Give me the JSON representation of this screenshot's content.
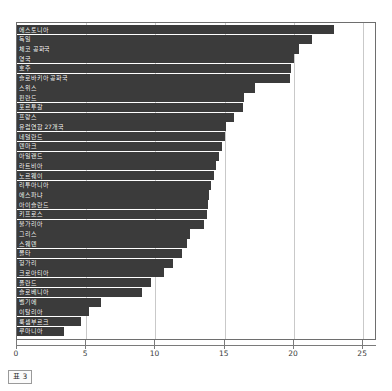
{
  "caption": "표 3",
  "chart_data": {
    "type": "bar",
    "orientation": "horizontal",
    "title": "",
    "subtitle": "",
    "xlabel": "",
    "ylabel": "",
    "xlim": [
      0,
      26
    ],
    "xticks": [
      0,
      5,
      10,
      15,
      20,
      25
    ],
    "tick_labels": [
      "0",
      "5",
      "10",
      "15",
      "20",
      "25"
    ],
    "grid": true,
    "legend": false,
    "bar_color": "#3b3b3b",
    "categories": [
      "에스토니아",
      "독일",
      "체코 공화국",
      "영국",
      "호주",
      "슬로바키아 공화국",
      "스위스",
      "핀란드",
      "포르투갈",
      "프랑스",
      "유럽연합 27개국",
      "네덜란드",
      "덴마크",
      "아일랜드",
      "라트비아",
      "노르웨이",
      "리투아니아",
      "에스파냐",
      "아이슬란드",
      "키프로스",
      "불가리아",
      "그리스",
      "스웨덴",
      "몰타",
      "헝가리",
      "크로아티아",
      "폴란드",
      "슬로베니아",
      "벨기에",
      "이탈리아",
      "룩셈부르크",
      "루마니아"
    ],
    "values": [
      22.9,
      21.3,
      20.4,
      20.0,
      19.8,
      19.7,
      17.2,
      16.4,
      16.3,
      15.7,
      15.1,
      15.0,
      14.8,
      14.6,
      14.4,
      14.2,
      14.0,
      13.9,
      13.8,
      13.7,
      13.5,
      12.5,
      12.3,
      11.9,
      11.3,
      10.6,
      9.7,
      9.0,
      6.1,
      5.2,
      4.6,
      3.4
    ]
  }
}
